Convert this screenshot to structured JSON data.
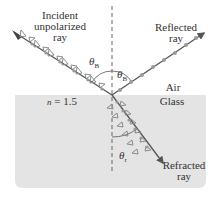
{
  "diagram": {
    "labels": {
      "incident": [
        "Incident",
        "unpolarized",
        "ray"
      ],
      "reflected": [
        "Reflected",
        "ray"
      ],
      "refracted": [
        "Refracted",
        "ray"
      ],
      "air": "Air",
      "glass": "Glass",
      "index": "n = 1.5",
      "index_symbol": "n",
      "index_value": "= 1.5",
      "theta_b_incident": "θ",
      "theta_b_incident_sub": "B",
      "theta_b_reflected": "θ",
      "theta_b_reflected_sub": "B",
      "theta_r": "θ",
      "theta_r_sub": "r"
    },
    "colors": {
      "glass_fill": "#e4e4e4",
      "ray": "#555555",
      "polarization_marker": "#8a8a8a",
      "normal_line": "#666666",
      "text": "#333333"
    }
  }
}
